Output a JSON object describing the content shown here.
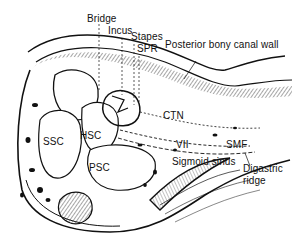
{
  "figure": {
    "type": "anatomical line drawing",
    "ink_color": "#111111",
    "background": "#ffffff"
  },
  "labels": {
    "bridge": "Bridge",
    "incus": "Incus",
    "stapes": "Stapes",
    "spr": "SPR",
    "posterior_bony_canal_wall": "Posterior bony canal wall",
    "ctn": "CTN",
    "ssc": "SSC",
    "hsc": "HSC",
    "psc": "PSC",
    "vii": "VII",
    "smf": "SMF",
    "sigmoid_sinus": "Sigmoid sinus",
    "digastric_ridge_line1": "Digastric",
    "digastric_ridge_line2": "ridge"
  }
}
